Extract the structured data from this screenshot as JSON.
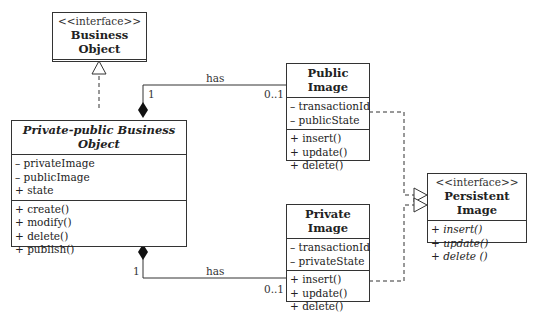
{
  "diagram": {
    "type": "uml-class-diagram",
    "classes": [
      {
        "id": "business_object",
        "stereotype": "<<interface>>",
        "name": "Business Object",
        "attributes": [],
        "operations": []
      },
      {
        "id": "private_public_business_object",
        "stereotype": "",
        "name": "Private-public Business Object",
        "attributes": [
          "– privateImage",
          "– publicImage",
          "+ state"
        ],
        "operations": [
          "+ create()",
          "+ modify()",
          "+ delete()",
          "+ publish()"
        ]
      },
      {
        "id": "public_image",
        "stereotype": "",
        "name": "Public Image",
        "attributes": [
          "– transactionId",
          "– publicState"
        ],
        "operations": [
          "+ insert()",
          "+ update()",
          "+ delete()"
        ]
      },
      {
        "id": "private_image",
        "stereotype": "",
        "name": "Private Image",
        "attributes": [
          "– transactionId",
          "– privateState"
        ],
        "operations": [
          "+ insert()",
          "+ update()",
          "+ delete()"
        ]
      },
      {
        "id": "persistent_image",
        "stereotype": "<<interface>>",
        "name": "Persistent Image",
        "attributes": [],
        "operations": [
          "+ insert()",
          "+ update()",
          "+ delete ()"
        ]
      }
    ],
    "relations": [
      {
        "type": "realization",
        "from": "private_public_business_object",
        "to": "business_object"
      },
      {
        "type": "composition",
        "from": "private_public_business_object",
        "to": "public_image",
        "label": "has",
        "source_multiplicity": "1",
        "target_multiplicity": "0..1"
      },
      {
        "type": "composition",
        "from": "private_public_business_object",
        "to": "private_image",
        "label": "has",
        "source_multiplicity": "1",
        "target_multiplicity": "0..1"
      },
      {
        "type": "realization",
        "from": "public_image",
        "to": "persistent_image"
      },
      {
        "type": "realization",
        "from": "private_image",
        "to": "persistent_image"
      }
    ],
    "labels": {
      "has_top": "has",
      "mult_top_source": "1",
      "mult_top_target": "0..1",
      "has_bottom": "has",
      "mult_bottom_source": "1",
      "mult_bottom_target": "0..1"
    }
  }
}
